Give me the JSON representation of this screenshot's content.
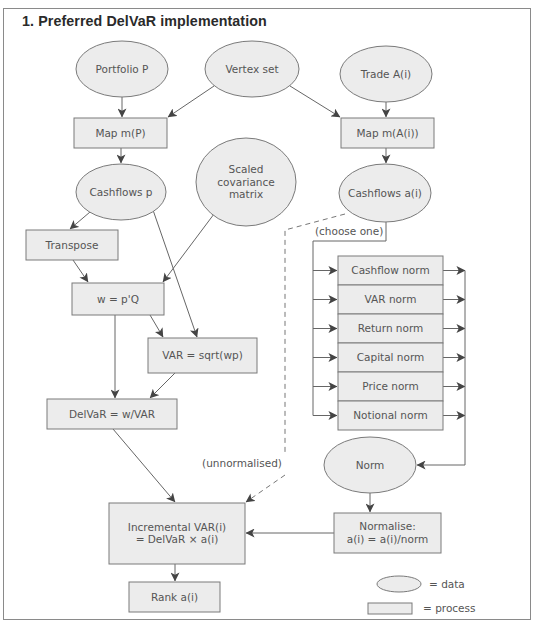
{
  "title": "1. Preferred DelVaR implementation",
  "colors": {
    "fill": "#ececec",
    "stroke": "#7a7a7a",
    "text": "#555555",
    "arrow": "#444444"
  },
  "nodes": {
    "portfolio": {
      "type": "data",
      "lines": [
        "Portfolio P"
      ],
      "cx": 122,
      "cy": 69,
      "rx": 46,
      "ry": 28
    },
    "vertex": {
      "type": "data",
      "lines": [
        "Vertex set"
      ],
      "cx": 252,
      "cy": 69,
      "rx": 47,
      "ry": 28
    },
    "trade": {
      "type": "data",
      "lines": [
        "Trade A(i)"
      ],
      "cx": 386,
      "cy": 74,
      "rx": 46,
      "ry": 28
    },
    "map_p": {
      "type": "process",
      "lines": [
        "Map m(P)"
      ],
      "x": 74,
      "y": 118,
      "w": 93,
      "h": 30
    },
    "map_a": {
      "type": "process",
      "lines": [
        "Map m(A(i))"
      ],
      "x": 341,
      "y": 118,
      "w": 93,
      "h": 30
    },
    "cashflows_p": {
      "type": "data",
      "lines": [
        "Cashflows p"
      ],
      "cx": 121,
      "cy": 192,
      "rx": 45,
      "ry": 28
    },
    "scaled_cov": {
      "type": "data",
      "lines": [
        "Scaled",
        "covariance",
        "matrix"
      ],
      "cx": 246,
      "cy": 182,
      "rx": 50,
      "ry": 44
    },
    "cashflows_a": {
      "type": "data",
      "lines": [
        "Cashflows a(i)"
      ],
      "cx": 385,
      "cy": 193,
      "rx": 46,
      "ry": 29
    },
    "transpose": {
      "type": "process",
      "lines": [
        "Transpose"
      ],
      "x": 26,
      "y": 230,
      "w": 92,
      "h": 30
    },
    "w_eq": {
      "type": "process",
      "lines": [
        "w = p'Q"
      ],
      "x": 72,
      "y": 283,
      "w": 92,
      "h": 32
    },
    "var_eq": {
      "type": "process",
      "lines": [
        "VAR = sqrt(wp)"
      ],
      "x": 148,
      "y": 338,
      "w": 109,
      "h": 35
    },
    "delvar": {
      "type": "process",
      "lines": [
        "DelVaR = w/VAR"
      ],
      "x": 47,
      "y": 399,
      "w": 130,
      "h": 30
    },
    "norm": {
      "type": "data",
      "lines": [
        "Norm"
      ],
      "cx": 370,
      "cy": 465,
      "rx": 46,
      "ry": 28
    },
    "normalise": {
      "type": "process",
      "lines": [
        "Normalise:",
        "a(i) = a(i)/norm"
      ],
      "x": 334,
      "y": 513,
      "w": 107,
      "h": 40
    },
    "incremental": {
      "type": "process",
      "lines": [
        "Incremental VAR(i)",
        "= DelVaR × a(i)"
      ],
      "x": 109,
      "y": 503,
      "w": 136,
      "h": 61
    },
    "rank": {
      "type": "process",
      "lines": [
        "Rank a(i)"
      ],
      "x": 129,
      "y": 582,
      "w": 91,
      "h": 30
    }
  },
  "norm_options": {
    "x": 338,
    "y": 256,
    "w": 105,
    "row_h": 29,
    "items": [
      "Cashflow norm",
      "VAR norm",
      "Return norm",
      "Capital norm",
      "Price norm",
      "Notional norm"
    ]
  },
  "annotations": {
    "choose_one": {
      "text": "(choose one)",
      "x": 315,
      "y": 235
    },
    "unnormalised": {
      "text": "(unnormalised)",
      "x": 242,
      "y": 467
    }
  },
  "legend": {
    "data_label": "= data",
    "process_label": "= process"
  }
}
